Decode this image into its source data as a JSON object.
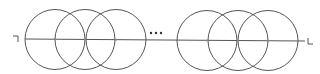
{
  "diagram": {
    "stroke_color": "#555555",
    "line": {
      "x1": 25,
      "y1": 39,
      "x2": 305,
      "y2": 41
    },
    "left_group": {
      "circles": [
        {
          "cx": 55,
          "cy": 39.5,
          "r": 30
        },
        {
          "cx": 85,
          "cy": 39.5,
          "r": 30
        },
        {
          "cx": 116,
          "cy": 39.5,
          "r": 30
        }
      ]
    },
    "right_group": {
      "circles": [
        {
          "cx": 207,
          "cy": 40.5,
          "r": 30
        },
        {
          "cx": 238,
          "cy": 40.5,
          "r": 30
        },
        {
          "cx": 268,
          "cy": 40.5,
          "r": 30
        }
      ]
    },
    "ellipsis": {
      "text": "···",
      "x": 147,
      "y": 33
    },
    "left_end_marker": {
      "text": "⌐",
      "x": 12,
      "y": 37
    },
    "right_end_marker": {
      "text": "L",
      "x": 306,
      "y": 45
    }
  }
}
